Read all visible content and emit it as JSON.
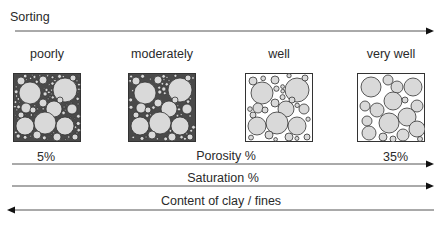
{
  "title": "Sorting",
  "sorting_classes": [
    {
      "label": "poorly",
      "packing": "poorly-sorted"
    },
    {
      "label": "moderately",
      "packing": "moderately-sorted"
    },
    {
      "label": "well",
      "packing": "well-sorted"
    },
    {
      "label": "very well",
      "packing": "very-well-sorted"
    }
  ],
  "porosity": {
    "label": "Porosity %",
    "min_label": "5%",
    "max_label": "35%",
    "direction": "increasing-right"
  },
  "saturation": {
    "label": "Saturation %",
    "direction": "increasing-right"
  },
  "clay": {
    "label": "Content of clay / fines",
    "direction": "increasing-left"
  },
  "colors": {
    "grain_fill": "#d9d9d9",
    "grain_stroke": "#333333",
    "matrix_dark": "#4a4a4a",
    "line": "#555555"
  }
}
